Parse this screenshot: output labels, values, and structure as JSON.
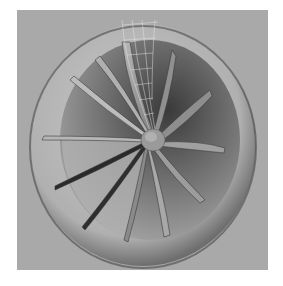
{
  "image": {
    "subject": "3D rendered turbine fan with outer ring shroud and curved blades",
    "background_color": "#ffffff",
    "frame_color": "#a8a8a8",
    "ring_color": "#b4b4b4",
    "interior_dark": "#5a5a5a",
    "interior_light": "#9a9a9a",
    "blade_count": 12,
    "highlighted_blade": "wireframe mesh on top blade"
  }
}
